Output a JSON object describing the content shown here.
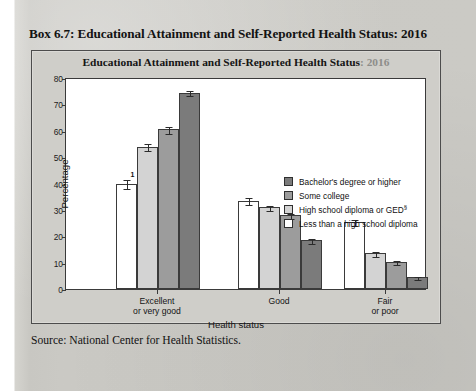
{
  "box": {
    "title": "Box 6.7: Educational Attainment and Self-Reported Health Status: 2016",
    "source": "Source: National Center for Health Statistics."
  },
  "figure": {
    "title_main": "Educational Attainment and Self-Reported Health Status",
    "title_year": ": 2016"
  },
  "colors": {
    "bachelors": "#7b7b7b",
    "some_college": "#9c9c9c",
    "high_school": "#d3d3d3",
    "less_than_hs": "#ffffff",
    "axis": "#3a3a3a",
    "page_background": "#c9c9c4",
    "frame_background": "#cfcec9"
  },
  "chart_data": {
    "type": "bar",
    "title": "Educational Attainment and Self-Reported Health Status: 2016",
    "xlabel": "Health status",
    "ylabel": "Percentage",
    "ylim": [
      0,
      80
    ],
    "yticks": [
      0,
      10,
      20,
      30,
      40,
      50,
      60,
      70,
      80
    ],
    "grid": false,
    "legend_position": "upper right inside",
    "categories": [
      "Excellent or very good",
      "Good",
      "Fair or poor"
    ],
    "category_lines": [
      [
        "Excellent",
        "or very good"
      ],
      [
        "Good",
        ""
      ],
      [
        "Fair",
        "or poor"
      ]
    ],
    "series": [
      {
        "name": "Less than a high school diploma",
        "color": "#ffffff",
        "values": [
          40.0,
          33.5,
          25.5
        ],
        "errors": [
          1.6,
          1.2,
          1.2
        ],
        "annotation": "1"
      },
      {
        "name": "High school diploma or GED",
        "color": "#d3d3d3",
        "values": [
          54.0,
          31.0,
          13.5
        ],
        "errors": [
          1.2,
          1.0,
          0.8
        ]
      },
      {
        "name": "Some college",
        "color": "#9c9c9c",
        "values": [
          60.5,
          28.0,
          10.3
        ],
        "errors": [
          1.3,
          1.0,
          0.7
        ]
      },
      {
        "name": "Bachelor's degree or higher",
        "color": "#7b7b7b",
        "values": [
          74.5,
          18.5,
          4.5
        ],
        "errors": [
          1.1,
          0.9,
          0.6
        ]
      }
    ]
  },
  "legend": {
    "items": [
      {
        "label": "Bachelor's degree or higher",
        "color": "#7b7b7b",
        "sup": ""
      },
      {
        "label": "Some college",
        "color": "#9c9c9c",
        "sup": ""
      },
      {
        "label": "High school diploma or GED",
        "color": "#d3d3d3",
        "sup": "§"
      },
      {
        "label": "Less than a high school diploma",
        "color": "#ffffff",
        "sup": ""
      }
    ]
  }
}
